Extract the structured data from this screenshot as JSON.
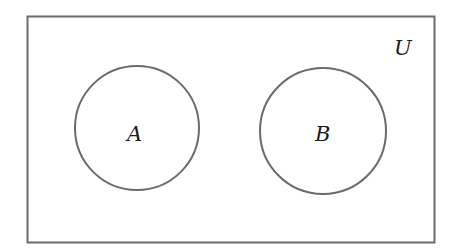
{
  "diagram": {
    "type": "venn",
    "universe": {
      "label": "U",
      "x": 27,
      "y": 16,
      "width": 408,
      "height": 227
    },
    "sets": [
      {
        "label": "A",
        "cx": 137,
        "cy": 128,
        "r": 62
      },
      {
        "label": "B",
        "cx": 323,
        "cy": 131,
        "r": 63
      }
    ],
    "relationship": "disjoint",
    "stroke_color": "#6b6b6b",
    "label_color": "#1a1a1a"
  }
}
